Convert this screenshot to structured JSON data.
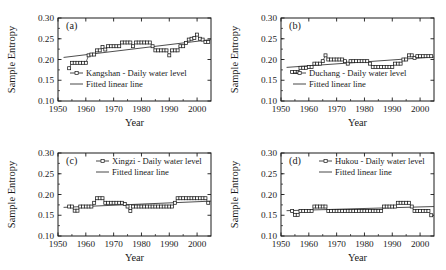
{
  "figure": {
    "title": "",
    "panel_count": 4
  },
  "axes": {
    "xlabel": "Year",
    "ylabel": "Sample Entropy",
    "xticks": [
      "1950",
      "1960",
      "1970",
      "1980",
      "1990",
      "2000"
    ],
    "yticks": [
      "0.10",
      "0.15",
      "0.20",
      "0.25",
      "0.30"
    ],
    "xlim": [
      1950,
      2005
    ],
    "ylim": [
      0.1,
      0.3
    ]
  },
  "legend": {
    "fitted_label": "Fitted linear line",
    "series_suffix": "Daily water level",
    "marker_icon": "open-square-marker",
    "line_icon": "solid-line"
  },
  "chart_data": [
    {
      "type": "line",
      "panel": "(a)",
      "title": "Kangshan - Daily water level",
      "fitted_label": "Fitted linear line",
      "xlabel": "Year",
      "ylabel": "Sample Entropy",
      "xlim": [
        1950,
        2005
      ],
      "ylim": [
        0.1,
        0.3
      ],
      "xticks": [
        1950,
        1960,
        1970,
        1980,
        1990,
        2000
      ],
      "yticks": [
        0.1,
        0.15,
        0.2,
        0.25,
        0.3
      ],
      "grid": false,
      "legend_position": "lower-left-inside",
      "x": [
        1954,
        1955,
        1956,
        1957,
        1958,
        1959,
        1960,
        1961,
        1962,
        1963,
        1964,
        1965,
        1966,
        1967,
        1968,
        1969,
        1970,
        1971,
        1972,
        1973,
        1974,
        1975,
        1976,
        1977,
        1978,
        1979,
        1980,
        1981,
        1982,
        1983,
        1984,
        1985,
        1986,
        1987,
        1988,
        1989,
        1990,
        1991,
        1992,
        1993,
        1994,
        1995,
        1996,
        1997,
        1998,
        1999,
        2000,
        2001,
        2002,
        2003,
        2004
      ],
      "y": [
        0.179,
        0.192,
        0.192,
        0.192,
        0.192,
        0.192,
        0.192,
        0.21,
        0.212,
        0.212,
        0.222,
        0.222,
        0.23,
        0.224,
        0.232,
        0.232,
        0.232,
        0.232,
        0.232,
        0.241,
        0.241,
        0.241,
        0.241,
        0.232,
        0.241,
        0.241,
        0.241,
        0.241,
        0.241,
        0.241,
        0.232,
        0.222,
        0.222,
        0.222,
        0.222,
        0.222,
        0.21,
        0.222,
        0.222,
        0.222,
        0.232,
        0.232,
        0.24,
        0.248,
        0.25,
        0.252,
        0.26,
        0.25,
        0.248,
        0.242,
        0.242
      ],
      "fit_line": {
        "x": [
          1952,
          2005
        ],
        "y": [
          0.205,
          0.248
        ]
      },
      "series": [
        {
          "name": "Kangshan - Daily water level",
          "marker": "open-square"
        },
        {
          "name": "Fitted linear line",
          "marker": "none"
        }
      ]
    },
    {
      "type": "line",
      "panel": "(b)",
      "title": "Duchang - Daily water level",
      "fitted_label": "Fitted linear line",
      "xlabel": "Year",
      "ylabel": "Sample Entropy",
      "xlim": [
        1950,
        2005
      ],
      "ylim": [
        0.1,
        0.3
      ],
      "xticks": [
        1950,
        1960,
        1970,
        1980,
        1990,
        2000
      ],
      "yticks": [
        0.1,
        0.15,
        0.2,
        0.25,
        0.3
      ],
      "grid": false,
      "legend_position": "lower-left-inside",
      "x": [
        1954,
        1955,
        1956,
        1957,
        1958,
        1959,
        1960,
        1961,
        1962,
        1963,
        1964,
        1965,
        1966,
        1967,
        1968,
        1969,
        1970,
        1971,
        1972,
        1973,
        1974,
        1975,
        1976,
        1977,
        1978,
        1979,
        1980,
        1981,
        1982,
        1983,
        1984,
        1985,
        1986,
        1987,
        1988,
        1989,
        1990,
        1991,
        1992,
        1993,
        1994,
        1995,
        1996,
        1997,
        1998,
        1999,
        2000,
        2001,
        2002,
        2003,
        2004
      ],
      "y": [
        0.17,
        0.17,
        0.17,
        0.18,
        0.18,
        0.18,
        0.182,
        0.182,
        0.19,
        0.19,
        0.19,
        0.196,
        0.21,
        0.2,
        0.2,
        0.2,
        0.2,
        0.2,
        0.2,
        0.196,
        0.19,
        0.196,
        0.196,
        0.196,
        0.196,
        0.196,
        0.196,
        0.196,
        0.19,
        0.182,
        0.182,
        0.182,
        0.182,
        0.182,
        0.182,
        0.182,
        0.182,
        0.19,
        0.19,
        0.19,
        0.2,
        0.2,
        0.21,
        0.21,
        0.204,
        0.208,
        0.208,
        0.208,
        0.208,
        0.208,
        0.208
      ],
      "fit_line": {
        "x": [
          1952,
          2005
        ],
        "y": [
          0.181,
          0.206
        ]
      },
      "series": [
        {
          "name": "Duchang - Daily water level",
          "marker": "open-square"
        },
        {
          "name": "Fitted linear line",
          "marker": "none"
        }
      ]
    },
    {
      "type": "line",
      "panel": "(c)",
      "title": "Xingzi - Daily water level",
      "fitted_label": "Fitted linear line",
      "xlabel": "Year",
      "ylabel": "Sample Entropy",
      "xlim": [
        1950,
        2005
      ],
      "ylim": [
        0.1,
        0.3
      ],
      "xticks": [
        1950,
        1960,
        1970,
        1980,
        1990,
        2000
      ],
      "yticks": [
        0.1,
        0.15,
        0.2,
        0.25,
        0.3
      ],
      "grid": false,
      "legend_position": "top-right-inside",
      "x": [
        1954,
        1955,
        1956,
        1957,
        1958,
        1959,
        1960,
        1961,
        1962,
        1963,
        1964,
        1965,
        1966,
        1967,
        1968,
        1969,
        1970,
        1971,
        1972,
        1973,
        1974,
        1975,
        1976,
        1977,
        1978,
        1979,
        1980,
        1981,
        1982,
        1983,
        1984,
        1985,
        1986,
        1987,
        1988,
        1989,
        1990,
        1991,
        1992,
        1993,
        1994,
        1995,
        1996,
        1997,
        1998,
        1999,
        2000,
        2001,
        2002,
        2003,
        2004
      ],
      "y": [
        0.171,
        0.171,
        0.161,
        0.161,
        0.171,
        0.171,
        0.171,
        0.171,
        0.171,
        0.18,
        0.191,
        0.191,
        0.191,
        0.18,
        0.18,
        0.18,
        0.18,
        0.18,
        0.18,
        0.18,
        0.177,
        0.171,
        0.16,
        0.171,
        0.171,
        0.171,
        0.171,
        0.171,
        0.171,
        0.171,
        0.171,
        0.171,
        0.171,
        0.171,
        0.171,
        0.171,
        0.171,
        0.171,
        0.18,
        0.191,
        0.191,
        0.191,
        0.191,
        0.191,
        0.191,
        0.191,
        0.191,
        0.191,
        0.191,
        0.191,
        0.18
      ],
      "fit_line": {
        "x": [
          1952,
          2005
        ],
        "y": [
          0.169,
          0.184
        ]
      },
      "series": [
        {
          "name": "Xingzi - Daily water level",
          "marker": "open-square"
        },
        {
          "name": "Fitted linear line",
          "marker": "none"
        }
      ]
    },
    {
      "type": "line",
      "panel": "(d)",
      "title": "Hukou - Daily water level",
      "fitted_label": "Fitted linear line",
      "xlabel": "Year",
      "ylabel": "Sample Entropy",
      "xlim": [
        1950,
        2005
      ],
      "ylim": [
        0.1,
        0.3
      ],
      "xticks": [
        1950,
        1960,
        1970,
        1980,
        1990,
        2000
      ],
      "yticks": [
        0.1,
        0.15,
        0.2,
        0.25,
        0.3
      ],
      "grid": false,
      "legend_position": "top-right-inside",
      "x": [
        1954,
        1955,
        1956,
        1957,
        1958,
        1959,
        1960,
        1961,
        1962,
        1963,
        1964,
        1965,
        1966,
        1967,
        1968,
        1969,
        1970,
        1971,
        1972,
        1973,
        1974,
        1975,
        1976,
        1977,
        1978,
        1979,
        1980,
        1981,
        1982,
        1983,
        1984,
        1985,
        1986,
        1987,
        1988,
        1989,
        1990,
        1991,
        1992,
        1993,
        1994,
        1995,
        1996,
        1997,
        1998,
        1999,
        2000,
        2001,
        2002,
        2003,
        2004
      ],
      "y": [
        0.16,
        0.151,
        0.151,
        0.16,
        0.16,
        0.16,
        0.16,
        0.16,
        0.171,
        0.171,
        0.171,
        0.171,
        0.171,
        0.16,
        0.16,
        0.16,
        0.16,
        0.16,
        0.16,
        0.16,
        0.16,
        0.16,
        0.16,
        0.16,
        0.16,
        0.16,
        0.16,
        0.16,
        0.16,
        0.16,
        0.16,
        0.16,
        0.16,
        0.171,
        0.171,
        0.171,
        0.171,
        0.171,
        0.18,
        0.18,
        0.18,
        0.18,
        0.18,
        0.171,
        0.16,
        0.16,
        0.16,
        0.16,
        0.16,
        0.16,
        0.15
      ],
      "fit_line": {
        "x": [
          1952,
          2005
        ],
        "y": [
          0.161,
          0.171
        ]
      },
      "series": [
        {
          "name": "Hukou - Daily water level",
          "marker": "open-square"
        },
        {
          "name": "Fitted linear line",
          "marker": "none"
        }
      ]
    }
  ]
}
